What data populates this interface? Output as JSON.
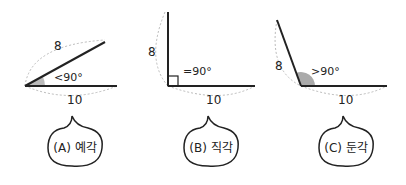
{
  "panels": [
    {
      "id": "A",
      "side_label": "8",
      "base_label": "10",
      "angle_label": "<90°",
      "caption": "(A) 예각"
    },
    {
      "id": "B",
      "side_label": "8",
      "base_label": "10",
      "angle_label": "=90°",
      "caption": "(B) 직각"
    },
    {
      "id": "C",
      "side_label": "8",
      "base_label": "10",
      "angle_label": ">90°",
      "caption": "(C) 둔각"
    }
  ],
  "colors": {
    "line": "#222222",
    "dashed": "#bbbbbb",
    "fill": "#aaaaaa"
  }
}
